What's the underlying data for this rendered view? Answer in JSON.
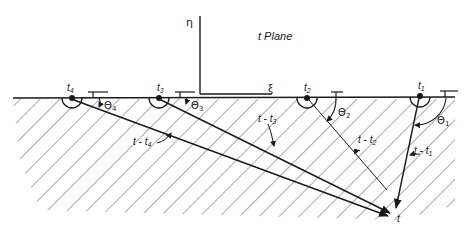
{
  "figure": {
    "plane_label": "t Plane",
    "axes": {
      "vertical": "η",
      "horizontal": "ξ"
    },
    "sources": [
      {
        "id": "t4",
        "label": "t",
        "sub": "4",
        "angle_label": "Θ",
        "angle_sub": "4",
        "vector_label": "t - t",
        "vector_sub": "4"
      },
      {
        "id": "t3",
        "label": "t",
        "sub": "3",
        "angle_label": "Θ",
        "angle_sub": "3",
        "vector_label": "t - t",
        "vector_sub": "3"
      },
      {
        "id": "t2",
        "label": "t",
        "sub": "2",
        "angle_label": "Θ",
        "angle_sub": "2",
        "vector_label": "t - t",
        "vector_sub": "2"
      },
      {
        "id": "t1",
        "label": "t",
        "sub": "1",
        "angle_label": "Θ",
        "angle_sub": "1",
        "vector_label": "t - t",
        "vector_sub": "1"
      }
    ],
    "target_label": "t",
    "colors": {
      "ink": "#1a1a1a",
      "hatch": "#444444",
      "background": "#ffffff"
    }
  }
}
